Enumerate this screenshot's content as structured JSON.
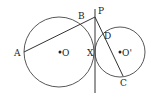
{
  "diagram": {
    "labels": {
      "A": "A",
      "B": "B",
      "P": "P",
      "D": "D",
      "X": "X",
      "O": "O",
      "O2": "O'",
      "C": "C"
    },
    "colors": {
      "stroke": "#333333",
      "fill": "#ffffff"
    }
  }
}
